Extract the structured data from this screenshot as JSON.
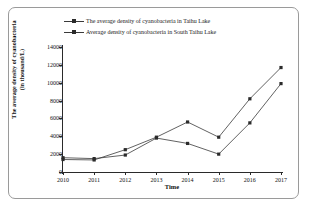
{
  "chart_data": {
    "type": "line",
    "title": "",
    "xlabel": "Time",
    "ylabel_line1": "The average density of cyanobacteria",
    "ylabel_line2": "(in thousand/L)",
    "categories": [
      "2010",
      "2011",
      "2012",
      "2013",
      "2014",
      "2015",
      "2016",
      "2017"
    ],
    "x": [
      2010,
      2011,
      2012,
      2013,
      2014,
      2015,
      2016,
      2017
    ],
    "xlim": [
      2010,
      2017
    ],
    "ylim": [
      0,
      14000
    ],
    "yticks": [
      0,
      2000,
      4000,
      6000,
      8000,
      10000,
      12000,
      14000
    ],
    "ytick_labels": [
      "0",
      "2000",
      "4000",
      "6000",
      "8000",
      "10000",
      "12000",
      "14000"
    ],
    "grid": false,
    "legend_position": "top-center",
    "marker": "square",
    "line_color": "#3a3a3a",
    "marker_color": "#2b2b2b",
    "series": [
      {
        "name": "The average density of cyanobacteria in Taihu Lake",
        "values": [
          1600,
          1500,
          1900,
          3800,
          3200,
          2000,
          5500,
          9900
        ]
      },
      {
        "name": "Average density of cyanobacteria in South Taihu Lake",
        "values": [
          1400,
          1350,
          2500,
          3900,
          5600,
          3900,
          8200,
          11700
        ]
      }
    ]
  },
  "legend": {
    "items": [
      {
        "label": "The average density of cyanobacteria in Taihu Lake"
      },
      {
        "label": "Average density of cyanobacteria in South Taihu Lake"
      }
    ]
  },
  "axes": {
    "x_title": "Time",
    "y_title_line1": "The average density of cyanobacteria",
    "y_title_line2": "(in thousand/L)",
    "y_labels": [
      "14000",
      "12000",
      "10000",
      "8000",
      "6000",
      "4000",
      "2000",
      "0"
    ],
    "x_labels": [
      "2010",
      "2011",
      "2012",
      "2013",
      "2014",
      "2015",
      "2016",
      "2017"
    ]
  }
}
